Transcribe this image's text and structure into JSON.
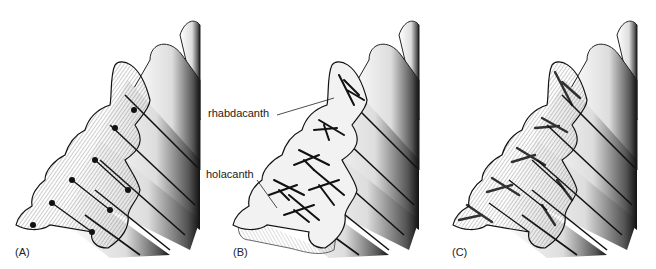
{
  "figure": {
    "panels": [
      {
        "id": "A",
        "label": "(A)",
        "description": "radiating fibrous spine structure"
      },
      {
        "id": "B",
        "label": "(B)",
        "description": "rhabdacanth and holacanth structures",
        "callouts": [
          "rhabdacanth",
          "holacanth"
        ]
      },
      {
        "id": "C",
        "label": "(C)",
        "description": "combined fibrous and dark trabecular structure"
      }
    ]
  },
  "colors": {
    "ink": "#111111",
    "background": "#ffffff"
  }
}
